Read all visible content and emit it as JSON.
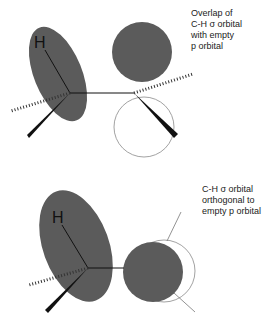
{
  "panels": [
    {
      "id": "overlap",
      "caption_lines": [
        "Overlap of",
        "C-H σ orbital",
        "with empty",
        "p orbital"
      ],
      "atom_label": "H",
      "orbital_fill": "#5b5b5b",
      "empty_lobe_stroke": "#8a8a8a",
      "bond_color": "#111111"
    },
    {
      "id": "orthogonal",
      "caption_lines": [
        "C-H σ orbital",
        "orthogonal to",
        "empty p orbital"
      ],
      "atom_label": "H",
      "orbital_fill": "#5b5b5b",
      "empty_lobe_stroke": "#8a8a8a",
      "bond_color": "#111111"
    }
  ]
}
